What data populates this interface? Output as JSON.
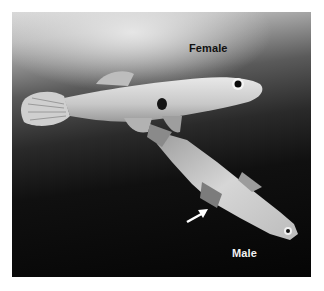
{
  "figure": {
    "labels": {
      "female": "Female",
      "male": "Male"
    },
    "annotations": {
      "arrow": "white-arrow-pointing-to-male-anal-fin"
    },
    "colors": {
      "background_light": "#d8d8d8",
      "background_dark": "#050505",
      "fish_body": "#cfcfcf",
      "male_label": "#f2f2f2",
      "female_label": "#111111"
    }
  }
}
